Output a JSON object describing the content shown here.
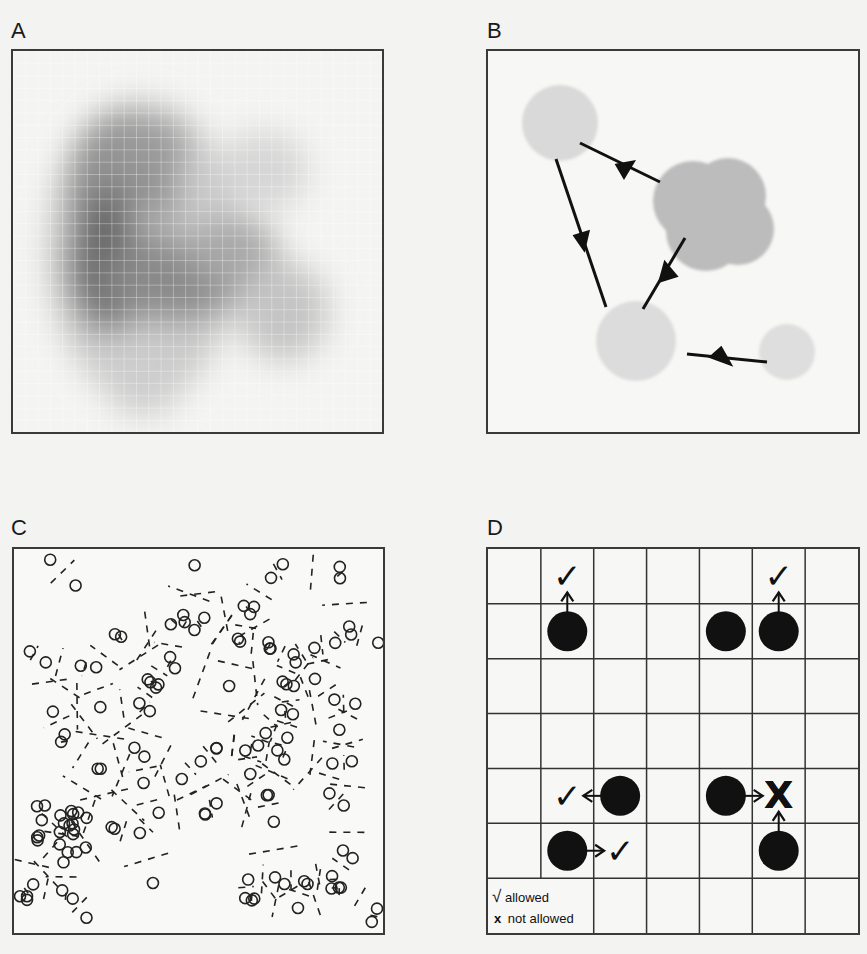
{
  "figure": {
    "panels": [
      {
        "id": "A",
        "label": "A",
        "kind": "continuum-density-grid"
      },
      {
        "id": "B",
        "label": "B",
        "kind": "cell-migration-arrows"
      },
      {
        "id": "C",
        "label": "C",
        "kind": "voronoi-particles"
      },
      {
        "id": "D",
        "label": "D",
        "kind": "lattice-exclusion-rules"
      }
    ],
    "panel_d": {
      "grid_rows": 7,
      "grid_cols": 7,
      "legend": {
        "allowed_symbol": "√",
        "allowed_label": "allowed",
        "not_allowed_symbol": "x",
        "not_allowed_label": "not allowed"
      },
      "moves": [
        {
          "from": [
            1,
            1
          ],
          "to": [
            0,
            1
          ],
          "result": "allowed"
        },
        {
          "from": [
            1,
            5
          ],
          "to": [
            0,
            5
          ],
          "result": "allowed",
          "note": "two agents adjacent"
        },
        {
          "from": [
            4,
            2
          ],
          "to": [
            4,
            1
          ],
          "result": "allowed"
        },
        {
          "from": [
            5,
            1
          ],
          "to": [
            5,
            2
          ],
          "result": "allowed"
        },
        {
          "from": [
            4,
            4
          ],
          "to": [
            4,
            5
          ],
          "result": "not allowed"
        },
        {
          "from": [
            5,
            5
          ],
          "to": [
            4,
            5
          ],
          "result": "not allowed"
        }
      ],
      "colors": {
        "agent": "#111111",
        "grid": "#333333"
      }
    }
  }
}
